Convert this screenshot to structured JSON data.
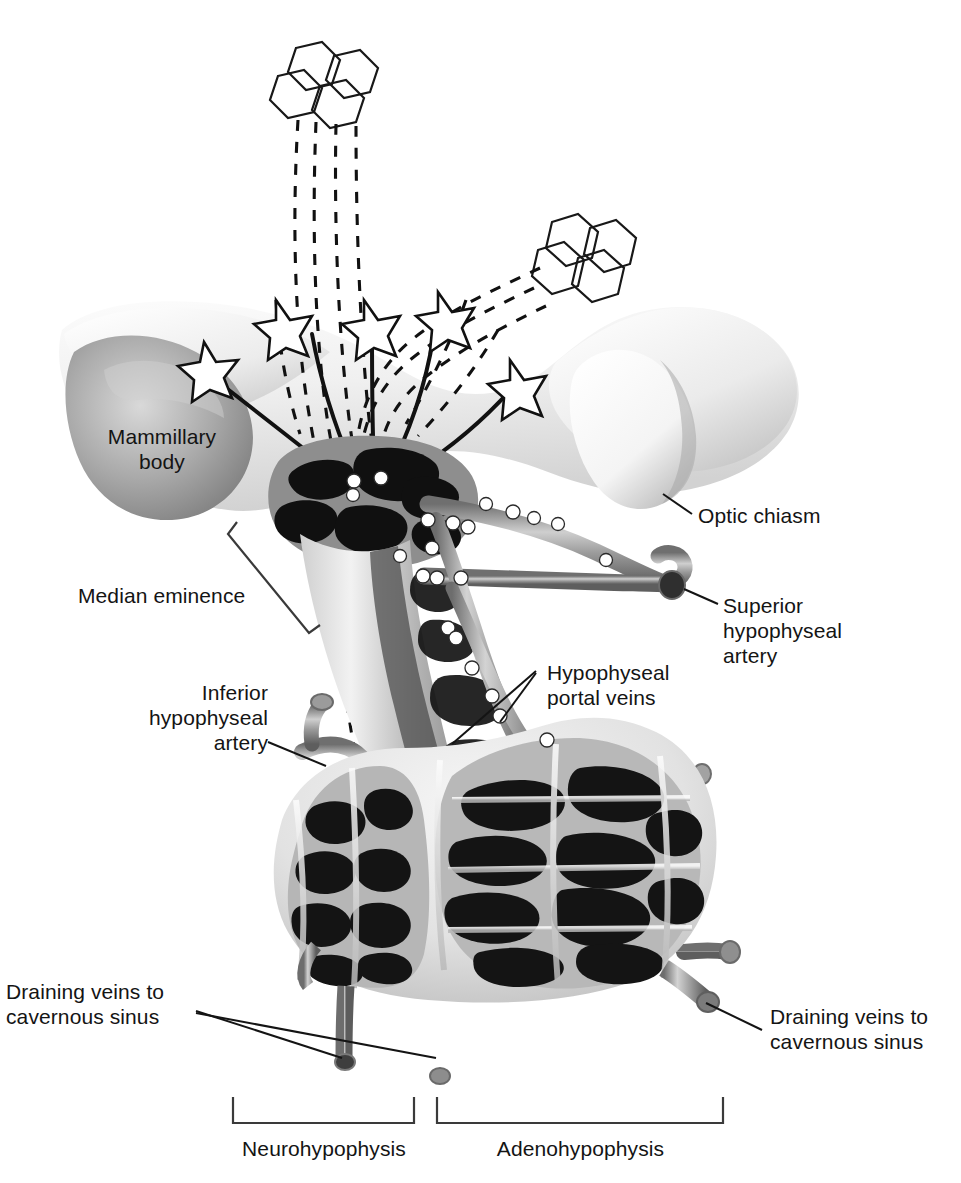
{
  "figure": {
    "background_color": "#ffffff",
    "ink_color": "#141414"
  },
  "labels": {
    "mammillary_body": "Mammillary\nbody",
    "median_eminence": "Median eminence",
    "optic_chiasm": "Optic chiasm",
    "superior_hypophyseal_artery": "Superior\nhypophyseal\nartery",
    "inferior_hypophyseal_artery": "Inferior\nhypophyseal\nartery",
    "hypophyseal_portal_veins": "Hypophyseal\nportal veins",
    "draining_veins_left": "Draining veins to\ncavernous sinus",
    "draining_veins_right": "Draining veins to\ncavernous sinus",
    "neurohypophysis": "Neurohypophysis",
    "adenohypophysis": "Adenohypophysis"
  },
  "structures": {
    "hypothalamus_tissue_color": "#efefef",
    "mammillary_body_color": "#9a9a9a",
    "optic_chiasm_color": "#fbfbfb",
    "vessel_color": "#8d8d8d",
    "vessel_dark_color": "#3a3a3a",
    "sinusoid_color": "#161616",
    "pituitary_capsule_color": "#d6d6d6",
    "marker_color": "#ffffff"
  },
  "neuron_symbols": {
    "hexagon_cluster_count": 2,
    "hexagons_per_cluster": 4,
    "star_count": 5,
    "dashed_axon_note": "dashed lines = magnocellular neurosecretory axons to neurohypophysis",
    "solid_axon_note": "solid lines = parvocellular axons terminating in median eminence"
  },
  "flow_markers": {
    "description": "white circles indicating direction of blood flow along vessels",
    "count": 22
  }
}
